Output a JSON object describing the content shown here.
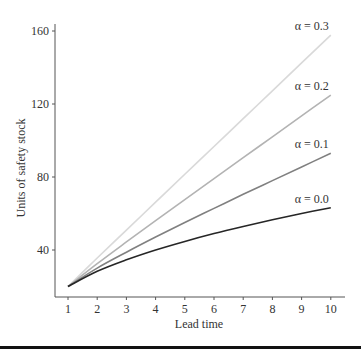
{
  "chart_data": {
    "type": "line",
    "title": "",
    "xlabel": "Lead time",
    "ylabel": "Units of safety stock",
    "x": [
      1,
      2,
      3,
      4,
      5,
      6,
      7,
      8,
      9,
      10
    ],
    "xticks": [
      "1",
      "2",
      "3",
      "4",
      "5",
      "6",
      "7",
      "8",
      "9",
      "10"
    ],
    "yticks": [
      "40",
      "80",
      "120",
      "160"
    ],
    "ytick_values": [
      40,
      80,
      120,
      160
    ],
    "xlim": [
      0.6,
      10.5
    ],
    "ylim": [
      12,
      164
    ],
    "grid": false,
    "legend_position": "inline labels at line ends",
    "series": [
      {
        "name": "α = 0.3",
        "color": "#d9d9d9",
        "values": [
          20,
          35.6,
          50.9,
          66.2,
          81.5,
          96.7,
          112.0,
          127.2,
          142.5,
          157.7
        ]
      },
      {
        "name": "α = 0.2",
        "color": "#b3b3b3",
        "values": [
          20,
          32.5,
          44.4,
          56.1,
          67.6,
          79.1,
          90.6,
          102.0,
          113.5,
          124.9
        ]
      },
      {
        "name": "α = 0.1",
        "color": "#808080",
        "values": [
          20,
          30.1,
          38.8,
          47.1,
          55.1,
          62.8,
          70.5,
          78.0,
          85.5,
          93.0
        ]
      },
      {
        "name": "α = 0.0",
        "color": "#262626",
        "values": [
          20,
          28.3,
          34.6,
          40.0,
          44.7,
          49.0,
          52.9,
          56.6,
          60.0,
          63.2
        ]
      }
    ]
  }
}
